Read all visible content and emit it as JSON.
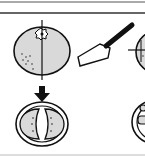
{
  "diagram": {
    "colors": {
      "background": "#ffffff",
      "fruit_fill": "#d9d9d9",
      "stroke": "#111111",
      "rule": "#333333",
      "bottom_rule": "#bbbbbb"
    },
    "elements": [
      {
        "id": "whole-fruit",
        "description": "whole citrus fruit with stem, vertical cut line"
      },
      {
        "id": "knife",
        "description": "kitchen knife"
      },
      {
        "id": "partial-fruit-right",
        "description": "second fruit partially visible with horizontal cut line"
      },
      {
        "id": "down-arrow",
        "description": "arrow pointing to result"
      },
      {
        "id": "halved-fruit",
        "description": "cross-section showing two halves"
      },
      {
        "id": "partial-cross-section-right",
        "description": "partially visible cross-section"
      }
    ]
  }
}
